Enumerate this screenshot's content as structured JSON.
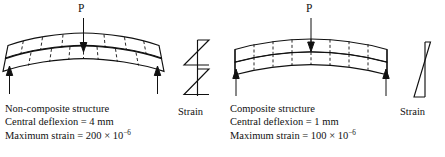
{
  "figure": {
    "type": "engineering-diagram"
  },
  "panels": [
    {
      "id": "non-composite",
      "load_label": "P",
      "caption": {
        "title": "Non-composite structure",
        "deflexion": "Central deflexion = 4 mm",
        "strain_prefix": "Maximum strain = 200 × 10",
        "strain_exponent": "−6"
      },
      "strain_label": "Strain",
      "strain_diagram": "double-zigzag",
      "beam": {
        "layers": 2,
        "slip": true,
        "segments": 8
      },
      "values": {
        "central_deflexion_mm": 4,
        "maximum_strain": 0.0002
      }
    },
    {
      "id": "composite",
      "load_label": "P",
      "caption": {
        "title": "Composite structure",
        "deflexion": "Central deflexion = 1 mm",
        "strain_prefix": "Maximum strain = 100 × 10",
        "strain_exponent": "−6"
      },
      "strain_label": "Strain",
      "strain_diagram": "single-bowtie",
      "beam": {
        "layers": 2,
        "slip": false,
        "segments": 8
      },
      "values": {
        "central_deflexion_mm": 1,
        "maximum_strain": 0.0001
      }
    }
  ],
  "colors": {
    "ink": "#111111",
    "background": "#ffffff"
  }
}
